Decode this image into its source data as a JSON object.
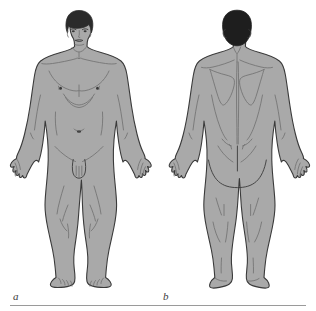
{
  "figure": {
    "background_color": "#ffffff",
    "rule_color": "#9a9a9a",
    "panels": [
      {
        "id": "anterior",
        "label": "a",
        "view_name": "anterior-view",
        "description": "Adult male figure, anterior (front) view, standing in anatomical position with arms slightly abducted and palms facing forward",
        "skin_fill": "#a9a9a9",
        "outline_color": "#3a3a3a",
        "hair_fill": "#2b2b2b",
        "detail_line_color": "#6e6e6e",
        "features": [
          "head-face",
          "hair",
          "neck",
          "clavicles",
          "shoulders",
          "pectoral-muscles",
          "nipples",
          "rib-margin",
          "abdomen",
          "umbilicus",
          "inguinal-creases",
          "external-genitalia",
          "arms",
          "elbows",
          "forearms",
          "hands",
          "fingers",
          "thighs",
          "knees",
          "patellae",
          "lower-legs",
          "ankles",
          "feet",
          "toes"
        ]
      },
      {
        "id": "posterior",
        "label": "b",
        "view_name": "posterior-view",
        "description": "Adult male figure, posterior (back) view, standing in anatomical position with arms slightly abducted",
        "skin_fill": "#a9a9a9",
        "outline_color": "#3a3a3a",
        "hair_fill": "#1e1e1e",
        "detail_line_color": "#6e6e6e",
        "features": [
          "back-of-head",
          "hair",
          "nape-of-neck",
          "trapezius",
          "scapulae",
          "vertebral-furrow",
          "latissimus-dorsi",
          "posterior-iliac-dimples",
          "gluteal-cleft",
          "buttocks",
          "arms",
          "olecranon",
          "forearms",
          "hands",
          "fingers",
          "posterior-thighs",
          "popliteal-fossae",
          "calves",
          "achilles-tendons",
          "heels",
          "feet"
        ]
      }
    ]
  }
}
